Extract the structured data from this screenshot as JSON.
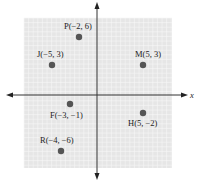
{
  "diagram": {
    "type": "coordinate-plane",
    "grid_color": "#e4e4e4",
    "grid_line_color": "#f6f6f6",
    "axis_color": "#333333",
    "point_color": "#555555",
    "x_axis_label": "x",
    "range": {
      "xmin": -8,
      "xmax": 8,
      "ymin": -8,
      "ymax": 8
    },
    "points": [
      {
        "name": "P",
        "x": -2,
        "y": 6,
        "label": "P(−2, 6)"
      },
      {
        "name": "J",
        "x": -5,
        "y": 3,
        "label": "J(−5, 3)"
      },
      {
        "name": "M",
        "x": 5,
        "y": 3,
        "label": "M(5, 3)"
      },
      {
        "name": "F",
        "x": -3,
        "y": -1,
        "label": "F(−3, −1)"
      },
      {
        "name": "H",
        "x": 5,
        "y": -2,
        "label": "H(5, −2)"
      },
      {
        "name": "R",
        "x": -4,
        "y": -6,
        "label": "R(−4, −6)"
      }
    ]
  }
}
